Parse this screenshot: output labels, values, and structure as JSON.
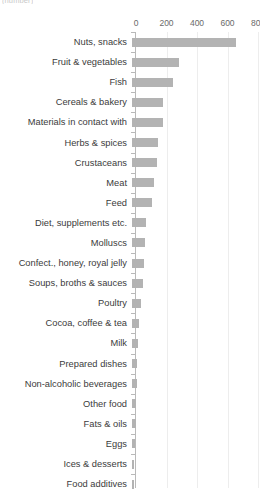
{
  "caption_fragment": "(number)",
  "axis": {
    "ticks": [
      0,
      200,
      400,
      600,
      800
    ],
    "tick_labels": [
      "0",
      "200",
      "400",
      "600",
      "800"
    ],
    "position": "top"
  },
  "colors": {
    "bar": "#b3b3b3",
    "gridline": "#ededed",
    "axis_line": "#b9b9b9",
    "label_text": "#3b3b3b",
    "tick_text": "#6a6a6a",
    "background": "#ffffff"
  },
  "chart_data": {
    "type": "bar",
    "orientation": "horizontal",
    "title": "",
    "subtitle": "",
    "xlabel": "",
    "ylabel": "",
    "xlim": [
      0,
      800
    ],
    "grid": true,
    "legend": false,
    "axis_position": "top",
    "categories": [
      "Nuts, snacks",
      "Fruit & vegetables",
      "Fish",
      "Cereals & bakery",
      "Materials in contact with",
      "Herbs & spices",
      "Crustaceans",
      "Meat",
      "Feed",
      "Diet, supplements etc.",
      "Molluscs",
      "Confect., honey, royal jelly",
      "Soups, broths & sauces",
      "Poultry",
      "Cocoa, coffee & tea",
      "Milk",
      "Prepared dishes",
      "Non-alcoholic beverages",
      "Other food",
      "Fats & oils",
      "Eggs",
      "Ices & desserts",
      "Food additives"
    ],
    "values": [
      680,
      310,
      270,
      205,
      200,
      170,
      165,
      145,
      130,
      95,
      85,
      80,
      70,
      60,
      45,
      42,
      35,
      32,
      28,
      25,
      20,
      15,
      10
    ]
  }
}
